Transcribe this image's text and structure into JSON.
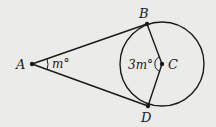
{
  "diagram": {
    "points": {
      "A": {
        "label": "A"
      },
      "B": {
        "label": "B"
      },
      "C": {
        "label": "C"
      },
      "D": {
        "label": "D"
      }
    },
    "angles": {
      "A": {
        "label": "m°"
      },
      "C": {
        "label": "3m°"
      }
    },
    "colors": {
      "stroke": "#1a1a1a",
      "background": "#ebebea"
    }
  }
}
